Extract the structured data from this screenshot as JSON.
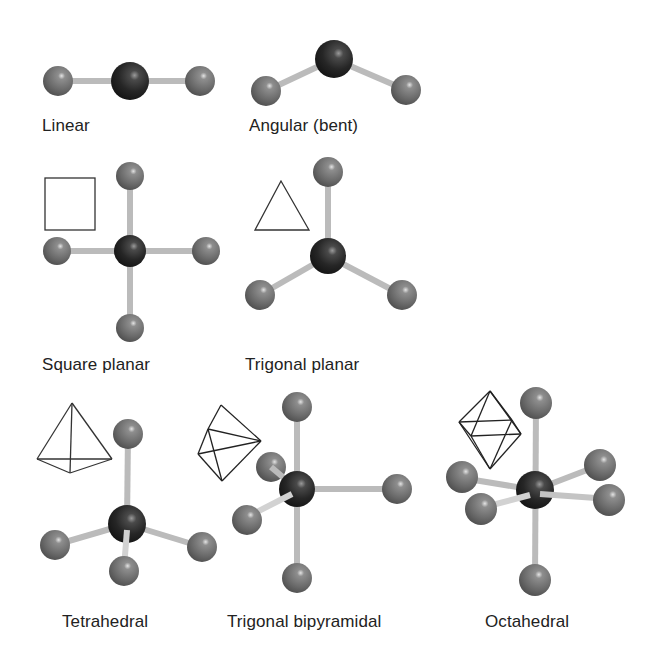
{
  "colors": {
    "central_atom": "#222222",
    "ligand_atom": "#6e6e6e",
    "bond": "#b8b8b8",
    "polyhedron_outline": "#222222",
    "label_text": "#222222",
    "background": "#ffffff"
  },
  "geometries": [
    {
      "name": "Linear",
      "ligand_count": 2,
      "polyhedron_icon": "none"
    },
    {
      "name": "Angular (bent)",
      "ligand_count": 2,
      "polyhedron_icon": "none"
    },
    {
      "name": "Square planar",
      "ligand_count": 4,
      "polyhedron_icon": "square-icon"
    },
    {
      "name": "Trigonal planar",
      "ligand_count": 3,
      "polyhedron_icon": "triangle-icon"
    },
    {
      "name": "Tetrahedral",
      "ligand_count": 4,
      "polyhedron_icon": "tetrahedron-icon"
    },
    {
      "name": "Trigonal bipyramidal",
      "ligand_count": 5,
      "polyhedron_icon": "trigonal-bipyramid-icon"
    },
    {
      "name": "Octahedral",
      "ligand_count": 6,
      "polyhedron_icon": "octahedron-icon"
    }
  ]
}
